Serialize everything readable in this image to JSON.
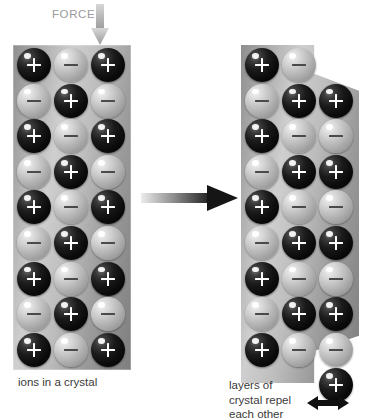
{
  "diagram": {
    "background_color": "#ffffff"
  },
  "force": {
    "label": "FORCE",
    "label_color": "#9a9a9a",
    "arrow_icon": "arrow-down-icon",
    "arrow_color": "#b0b0b0",
    "direction": "down"
  },
  "transition": {
    "arrow_icon": "arrow-right-icon",
    "direction": "right",
    "gradient_from": "#e8e8e8",
    "gradient_to": "#1a1a1a"
  },
  "ion_legend": {
    "positive_symbol": "+",
    "negative_symbol": "−",
    "positive_color": "#0b0b0b",
    "negative_color": "#bfbfbf"
  },
  "crystals": [
    {
      "id": "undisturbed",
      "caption": "ions in a crystal",
      "columns": 3,
      "rows": 9,
      "shape": "rectangle",
      "description": "regular alternating lattice",
      "grid": [
        [
          "+",
          "−",
          "+"
        ],
        [
          "−",
          "+",
          "−"
        ],
        [
          "+",
          "−",
          "+"
        ],
        [
          "−",
          "+",
          "−"
        ],
        [
          "+",
          "−",
          "+"
        ],
        [
          "−",
          "+",
          "−"
        ],
        [
          "+",
          "−",
          "+"
        ],
        [
          "−",
          "+",
          "−"
        ],
        [
          "+",
          "−",
          "+"
        ]
      ]
    },
    {
      "id": "displaced",
      "caption_lines": [
        "layers of",
        "crystal repel",
        "each other"
      ],
      "columns": 3,
      "rows": 10,
      "shape": "stepped",
      "description": "right layer slipped down by one row; like charges now face each other",
      "slip_arrow_icon": "arrow-left-right-icon",
      "slip_arrow_color": "#101010",
      "grid": [
        [
          "+",
          "−",
          ""
        ],
        [
          "−",
          "+",
          "+"
        ],
        [
          "+",
          "−",
          "−"
        ],
        [
          "−",
          "+",
          "+"
        ],
        [
          "+",
          "−",
          "−"
        ],
        [
          "−",
          "+",
          "+"
        ],
        [
          "+",
          "−",
          "−"
        ],
        [
          "−",
          "+",
          "+"
        ],
        [
          "+",
          "−",
          "−"
        ],
        [
          "",
          "",
          "+"
        ]
      ]
    }
  ]
}
